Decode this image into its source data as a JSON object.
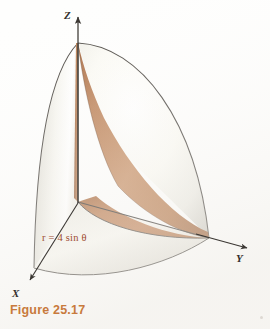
{
  "figure": {
    "caption": "Figure 25.17",
    "equation_label": "r = 4 sin θ",
    "equation_parts": {
      "variable": "r",
      "equals": "=",
      "coefficient": "4",
      "function": "sin",
      "angle": "θ"
    },
    "axes": [
      {
        "name": "z-axis",
        "label": "Z",
        "direction": "up"
      },
      {
        "name": "y-axis",
        "label": "Y",
        "direction": "lower-right"
      },
      {
        "name": "x-axis",
        "label": "X",
        "direction": "lower-left"
      }
    ],
    "axis_labels": {
      "z": "Z",
      "y": "Y",
      "x": "X"
    },
    "icons": {
      "z_arrow": "arrow-up-icon",
      "y_arrow": "arrow-right-icon",
      "x_arrow": "arrow-down-left-icon"
    },
    "colors": {
      "outer_surface_light": "#fdfcf7",
      "outer_surface_shadow": "#cfcdc6",
      "inner_surface_brown": "#b87a4e",
      "inner_surface_brown_dark": "#9d5f35",
      "inner_surface_brown_light": "#d2a07a",
      "base_brown": "#bc7f52",
      "outline": "#3b3733",
      "axis_color": "#3b3733",
      "equation_text": "#9e4b32",
      "caption_text": "#c87a3c",
      "background": "#fefefd"
    },
    "description": {
      "type": "3d-solid-region",
      "surface": "hemispherical dome (sphere octant) cut by a cylinder",
      "cylinder_equation": "r = 4 sin θ",
      "shaded_inner_face": "brown",
      "shaded_outer_face": "off-white"
    }
  }
}
